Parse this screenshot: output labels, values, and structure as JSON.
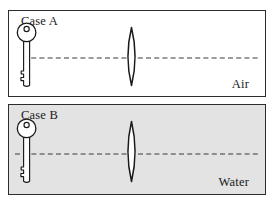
{
  "figure": {
    "width": 274,
    "height": 204,
    "background_color": "#ffffff",
    "stroke_color": "#2c2c2c"
  },
  "panels": [
    {
      "id": "air",
      "case_label": "Case A",
      "medium_label": "Air",
      "background_color": "#ffffff",
      "object": {
        "name": "key",
        "fill": "#ffffff",
        "stroke": "#1a1a1a",
        "position": "left"
      },
      "lens": {
        "name": "biconvex-lens",
        "type": "converging",
        "fill": "#ffffff",
        "stroke": "#1a1a1a",
        "position": "center"
      },
      "axis": {
        "name": "optical-axis",
        "style": "dashed",
        "color": "#3a3a3a"
      }
    },
    {
      "id": "water",
      "case_label": "Case B",
      "medium_label": "Water",
      "background_color": "#e3e3e3",
      "object": {
        "name": "key",
        "fill": "#ffffff",
        "stroke": "#1a1a1a",
        "position": "left"
      },
      "lens": {
        "name": "biconvex-lens",
        "type": "converging",
        "fill": "#ffffff",
        "stroke": "#1a1a1a",
        "position": "center"
      },
      "axis": {
        "name": "optical-axis",
        "style": "dashed",
        "color": "#3a3a3a"
      }
    }
  ]
}
